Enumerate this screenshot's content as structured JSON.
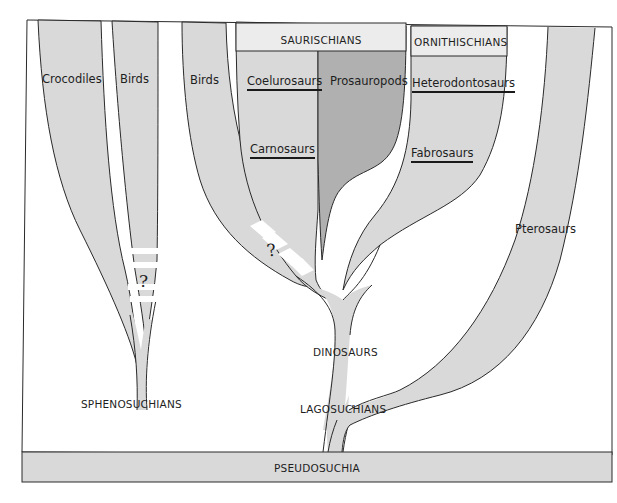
{
  "diagram": {
    "colors": {
      "branch_fill": "#d9d9d9",
      "prosauropod_fill": "#b0b0b0",
      "header_fill": "#ececec",
      "outline": "#2a2a2a",
      "background": "#ffffff"
    },
    "base": {
      "label": "PSEUDOSUCHIA"
    },
    "branches": {
      "crocodiles": "Crocodiles",
      "birds_left": "Birds",
      "birds_middle": "Birds",
      "pterosaurs": "Pterosaurs"
    },
    "groups": {
      "saurischians": {
        "header": "SAURISCHIANS",
        "members": [
          "Coelurosaurs",
          "Prosauropods",
          "Carnosaurs"
        ]
      },
      "ornithischians": {
        "header": "ORNITHISCHIANS",
        "members": [
          "Heterodontosaurs",
          "Fabrosaurs"
        ]
      }
    },
    "nodes": {
      "sphenosuchians": "SPHENOSUCHIANS",
      "dinosaurs": "DINOSAURS",
      "lagosuchians": "LAGOSUCHIANS"
    },
    "uncertain_marks": [
      "?",
      "?"
    ]
  }
}
